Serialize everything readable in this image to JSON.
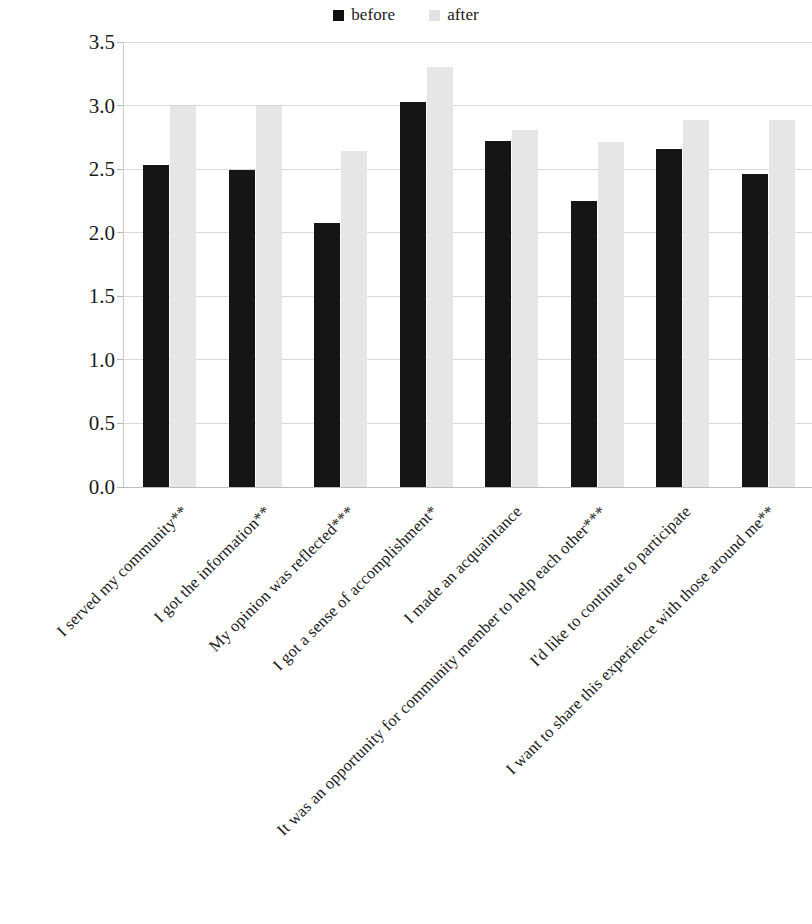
{
  "legend": {
    "entries": [
      {
        "label": "before",
        "color": "#151515"
      },
      {
        "label": "after",
        "color": "#e6e6e6"
      }
    ]
  },
  "axis": {
    "y_ticks": [
      "0.0",
      "0.5",
      "1.0",
      "1.5",
      "2.0",
      "2.5",
      "3.0",
      "3.5"
    ]
  },
  "chart_data": {
    "type": "bar",
    "title": "",
    "xlabel": "",
    "ylabel": "",
    "ylim": [
      0,
      3.5
    ],
    "ytick_step": 0.5,
    "grid": true,
    "legend_position": "top-center",
    "categories": [
      "I served my community**",
      "I got the information**",
      "My opinion was reflected***",
      "I got a sense of accomplishment*",
      "I made an acquaintance",
      "It was an opportunity for community member to help each other***",
      "I'd like to continue to participate",
      "I want to share this experience with those around me**"
    ],
    "series": [
      {
        "name": "before",
        "color": "#151515",
        "values": [
          2.53,
          2.49,
          2.08,
          3.03,
          2.72,
          2.25,
          2.66,
          2.46
        ]
      },
      {
        "name": "after",
        "color": "#e6e6e6",
        "values": [
          3.0,
          3.0,
          2.64,
          3.3,
          2.81,
          2.71,
          2.89,
          2.89
        ]
      }
    ]
  }
}
